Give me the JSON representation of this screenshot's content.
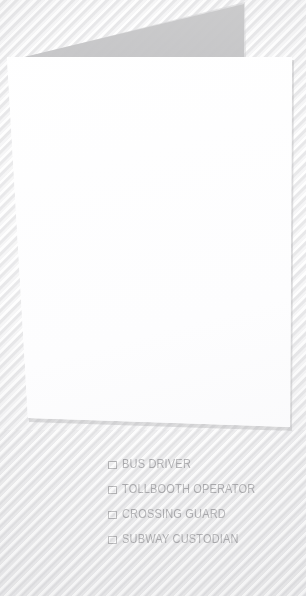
{
  "document": {
    "type": "printed-checkbox-form-card",
    "card_color": "#ffffff",
    "background_color": "#ececed",
    "shadow_color": "#c9c9ca",
    "text_color": "#9a9a9d",
    "checkbox_border_color": "#a4a4a6"
  },
  "card": {
    "content": ""
  },
  "options": {
    "items": [
      {
        "label": "BUS DRIVER",
        "checked": false,
        "checkbox_icon": "checkbox-empty-icon"
      },
      {
        "label": "TOLLBOOTH OPERATOR",
        "checked": false,
        "checkbox_icon": "checkbox-empty-icon"
      },
      {
        "label": "CROSSING GUARD",
        "checked": false,
        "checkbox_icon": "checkbox-empty-icon"
      },
      {
        "label": "SUBWAY CUSTODIAN",
        "checked": false,
        "checkbox_icon": "checkbox-empty-icon"
      }
    ]
  }
}
